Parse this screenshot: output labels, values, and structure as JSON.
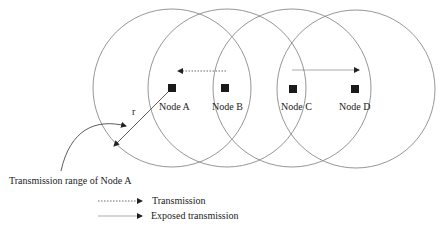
{
  "nodes": [
    {
      "id": "A",
      "label": "Node A"
    },
    {
      "id": "B",
      "label": "Node B"
    },
    {
      "id": "C",
      "label": "Node C"
    },
    {
      "id": "D",
      "label": "Node D"
    }
  ],
  "radius_label": "r",
  "range_annotation": "Transmission range of Node A",
  "edges": [
    {
      "from": "B",
      "to": "A",
      "type": "Transmission",
      "style": "dotted"
    },
    {
      "from": "C",
      "to": "D",
      "type": "Exposed transmission",
      "style": "solid"
    }
  ],
  "legend": {
    "transmission": "Transmission",
    "exposed": "Exposed transmission"
  },
  "colors": {
    "circle": "#8a8a8a",
    "node": "#1a1a1a",
    "text": "#222222"
  }
}
